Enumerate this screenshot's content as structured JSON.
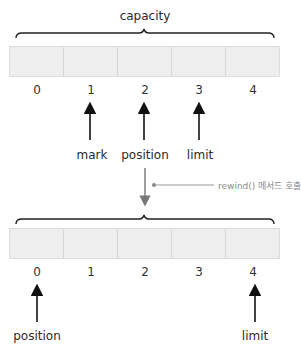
{
  "top": {
    "brace_label": "capacity",
    "cells": [
      "",
      "",
      "",
      "",
      ""
    ],
    "indices": [
      "0",
      "1",
      "2",
      "3",
      "4"
    ],
    "pointers": [
      {
        "label": "mark",
        "index": 1
      },
      {
        "label": "position",
        "index": 2
      },
      {
        "label": "limit",
        "index": 3
      }
    ]
  },
  "transition": {
    "note": "rewind() 메서드 호출"
  },
  "bottom": {
    "cells": [
      "",
      "",
      "",
      "",
      ""
    ],
    "indices": [
      "0",
      "1",
      "2",
      "3",
      "4"
    ],
    "pointers": [
      {
        "label": "position",
        "index": 0
      },
      {
        "label": "limit",
        "index": 4
      }
    ]
  },
  "colors": {
    "cell_fill": "#eeeeee",
    "cell_border": "#d6d6d6",
    "arrow": "#111111",
    "transition_arrow": "#777777",
    "note_text": "#8a8a8a"
  }
}
